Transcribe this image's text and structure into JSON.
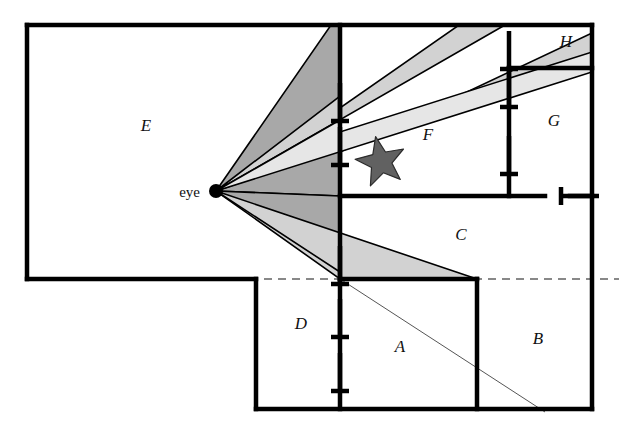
{
  "figure": {
    "type": "floor-plan-visibility-diagram",
    "background": "#ffffff",
    "width": 619,
    "height": 427,
    "viewpoint_label": "eye",
    "viewpoint": {
      "x": 216,
      "y": 191,
      "dot_radius": 7
    }
  },
  "colors": {
    "wall": "#000000",
    "dark_cone": "#a8a8a8",
    "light_cone": "#d2d2d2",
    "pale_cone": "#e6e6e6",
    "star_fill": "#616161",
    "thin_line": "#555555",
    "dashed_line": "#888888",
    "text": "#111111"
  },
  "room_labels": [
    {
      "name": "A",
      "x": 400,
      "y": 352
    },
    {
      "name": "B",
      "x": 538,
      "y": 344
    },
    {
      "name": "C",
      "x": 461,
      "y": 240
    },
    {
      "name": "D",
      "x": 301,
      "y": 329
    },
    {
      "name": "E",
      "x": 146,
      "y": 131
    },
    {
      "name": "F",
      "x": 428,
      "y": 140
    },
    {
      "name": "G",
      "x": 554,
      "y": 126
    },
    {
      "name": "H",
      "x": 566,
      "y": 47
    }
  ],
  "walls": [
    {
      "name": "outer-top",
      "x1": 27,
      "y1": 25,
      "x2": 592,
      "y2": 25
    },
    {
      "name": "outer-right",
      "x1": 592,
      "y1": 25,
      "x2": 592,
      "y2": 409
    },
    {
      "name": "outer-bottom",
      "x1": 592,
      "y1": 409,
      "x2": 256,
      "y2": 409
    },
    {
      "name": "lower-left-riser",
      "x1": 256,
      "y1": 409,
      "x2": 256,
      "y2": 279
    },
    {
      "name": "room-e-bottom",
      "x1": 256,
      "y1": 279,
      "x2": 27,
      "y2": 279
    },
    {
      "name": "outer-left",
      "x1": 27,
      "y1": 279,
      "x2": 27,
      "y2": 25
    },
    {
      "name": "spine-vertical",
      "x1": 340,
      "y1": 25,
      "x2": 340,
      "y2": 279
    },
    {
      "name": "spine-lower",
      "x1": 340,
      "y1": 279,
      "x2": 340,
      "y2": 409
    },
    {
      "name": "c-bottom",
      "x1": 340,
      "y1": 279,
      "x2": 477,
      "y2": 279
    },
    {
      "name": "a-b-divider",
      "x1": 477,
      "y1": 279,
      "x2": 477,
      "y2": 409
    },
    {
      "name": "f-bottom",
      "x1": 340,
      "y1": 196,
      "x2": 545,
      "y2": 196
    },
    {
      "name": "g-left",
      "x1": 509,
      "y1": 68,
      "x2": 509,
      "y2": 196
    },
    {
      "name": "h-bottom",
      "x1": 509,
      "y1": 68,
      "x2": 592,
      "y2": 68
    },
    {
      "name": "c-right-stub",
      "x1": 570,
      "y1": 196,
      "x2": 592,
      "y2": 196
    }
  ],
  "doorways": [
    {
      "name": "door-spine-upper",
      "x": 340,
      "y": 102
    },
    {
      "name": "door-spine-mid",
      "x": 340,
      "y": 146
    },
    {
      "name": "door-spine-lower",
      "x": 340,
      "y": 265
    },
    {
      "name": "door-spine-d1",
      "x": 340,
      "y": 318
    },
    {
      "name": "door-spine-d2",
      "x": 340,
      "y": 372
    },
    {
      "name": "door-g-left-top",
      "x": 509,
      "y": 50
    },
    {
      "name": "door-g-left-bot",
      "x": 509,
      "y": 88
    },
    {
      "name": "door-g-left-low",
      "x": 509,
      "y": 155
    },
    {
      "name": "door-c-right",
      "x": 580,
      "y": 196
    }
  ],
  "dashed_divider": {
    "name": "sight-baseline",
    "x1": 250,
    "y1": 279,
    "x2": 619,
    "y2": 279
  },
  "thin_ray": {
    "name": "far-sight-ray",
    "x1": 337,
    "y1": 277,
    "x2": 545,
    "y2": 412
  },
  "star": {
    "name": "target-object",
    "cx": 381,
    "cy": 162,
    "outer_r": 26,
    "inner_r": 11,
    "points": 5,
    "rotation": -12
  },
  "visibility_cones": [
    {
      "name": "cone-main-upper",
      "shade": "dark",
      "points": "216,191 331,25 340,25 340,196"
    },
    {
      "name": "cone-through-upper-door",
      "shade": "light",
      "points": "216,191 340,96 340,108 459,25 505,25"
    },
    {
      "name": "cone-through-mid-door",
      "shade": "light",
      "points": "216,191 340,140 340,152 592,33 592,62"
    },
    {
      "name": "cone-pale-sliver",
      "shade": "pale",
      "points": "216,191 340,120 340,132 592,52 592,72"
    },
    {
      "name": "cone-main-lower",
      "shade": "dark",
      "points": "216,191 340,196 340,279 340,262"
    },
    {
      "name": "cone-lower-door",
      "shade": "light",
      "points": "216,191 340,258 340,271 477,279 340,279"
    },
    {
      "name": "cone-lower-door-b",
      "shade": "light",
      "points": "216,191 340,272 340,279 477,279"
    }
  ]
}
